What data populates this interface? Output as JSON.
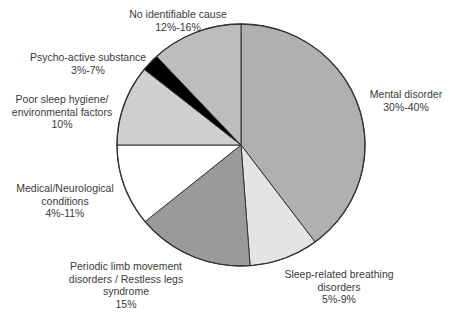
{
  "chart_data": {
    "type": "pie",
    "title": "",
    "start_angle_deg": 0,
    "direction": "clockwise",
    "slices": [
      {
        "label": "Mental disorder",
        "value_text": "30%-40%",
        "approx_share": 39.8,
        "start_deg": 0,
        "end_deg": 143.3,
        "color": "#b0b0b0"
      },
      {
        "label": "Sleep-related breathing disorders",
        "value_text": "5%-9%",
        "approx_share": 9.0,
        "start_deg": 143.3,
        "end_deg": 175.8,
        "color": "#e4e4e4"
      },
      {
        "label": "Periodic limb movement disorders / Restless legs syndrome",
        "value_text": "15%",
        "approx_share": 15.2,
        "start_deg": 175.8,
        "end_deg": 230.7,
        "color": "#9a9a9a"
      },
      {
        "label": "Medical/Neurological conditions",
        "value_text": "4%-11%",
        "approx_share": 10.9,
        "start_deg": 230.7,
        "end_deg": 270,
        "color": "#ffffff"
      },
      {
        "label": "Poor sleep hygiene/ environmental factors",
        "value_text": "10%",
        "approx_share": 10.7,
        "start_deg": 270,
        "end_deg": 308.7,
        "color": "#cfcfcf"
      },
      {
        "label": "Psycho-active substance",
        "value_text": "3%-7%",
        "approx_share": 2.3,
        "start_deg": 308.7,
        "end_deg": 317.1,
        "color": "#000000"
      },
      {
        "label": "No identifiable cause",
        "value_text": "12%-16%",
        "approx_share": 11.9,
        "start_deg": 317.1,
        "end_deg": 360,
        "color": "#bdbdbd"
      }
    ],
    "legend": "none (direct labels)",
    "grid": false
  },
  "labels": {
    "mental": {
      "line1": "Mental disorder",
      "line2": "30%-40%"
    },
    "sleep": {
      "line1": "Sleep-related breathing",
      "line2": "disorders",
      "line3": "5%-9%"
    },
    "plm": {
      "line1": "Periodic limb movement",
      "line2": "disorders / Restless legs",
      "line3": "syndrome",
      "line4": "15%"
    },
    "medical": {
      "line1": "Medical/Neurological",
      "line2": "conditions",
      "line3": "4%-11%"
    },
    "hygiene": {
      "line1": "Poor sleep hygiene/",
      "line2": "environmental factors",
      "line3": "10%"
    },
    "psycho": {
      "line1": "Psycho-active substance",
      "line2": "3%-7%"
    },
    "none": {
      "line1": "No identifiable cause",
      "line2": "12%-16%"
    }
  }
}
